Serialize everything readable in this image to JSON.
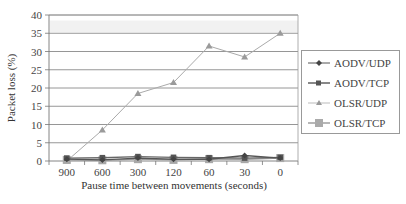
{
  "chart_data": {
    "type": "line",
    "title": "",
    "xlabel": "Pause time between movements (seconds)",
    "ylabel": "Packet loss (%)",
    "categories": [
      "900",
      "600",
      "300",
      "120",
      "60",
      "30",
      "0"
    ],
    "ylim": [
      0,
      40
    ],
    "yticks": [
      "0",
      "5",
      "10",
      "15",
      "20",
      "25",
      "30",
      "35",
      "40"
    ],
    "grid": true,
    "legend_position": "right",
    "series": [
      {
        "name": "AODV/UDP",
        "marker": "diamond",
        "color": "#555555",
        "values": [
          0.5,
          0.3,
          0.8,
          0.5,
          0.5,
          1.5,
          0.8
        ]
      },
      {
        "name": "AODV/TCP",
        "marker": "square-small",
        "color": "#666666",
        "values": [
          0.8,
          0.9,
          1.2,
          1.0,
          0.9,
          0.8,
          1.0
        ]
      },
      {
        "name": "OLSR/UDP",
        "marker": "triangle",
        "color": "#aaaaaa",
        "values": [
          0.0,
          8.5,
          18.5,
          21.5,
          31.5,
          28.5,
          35.0
        ]
      },
      {
        "name": "OLSR/TCP",
        "marker": "square",
        "color": "#999999",
        "values": [
          0.3,
          0.2,
          0.5,
          0.3,
          0.5,
          0.5,
          0.8
        ]
      }
    ]
  },
  "legend": {
    "items": [
      "AODV/UDP",
      "AODV/TCP",
      "OLSR/UDP",
      "OLSR/TCP"
    ]
  }
}
